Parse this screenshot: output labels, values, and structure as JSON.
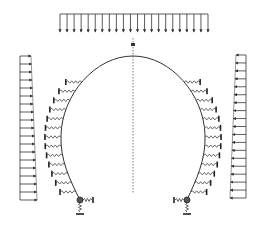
{
  "diagram": {
    "title": "",
    "type": "tunnel-lining-structural-model",
    "colors": {
      "line": "#333333",
      "spring": "#444444",
      "background": "#ffffff"
    },
    "elements": {
      "top_load": {
        "kind": "uniform-vertical-distributed-load",
        "arrow_count": 22,
        "direction": "down"
      },
      "left_side_load": {
        "kind": "trapezoidal-horizontal-distributed-load",
        "arrow_count": 19,
        "direction": "right"
      },
      "right_side_load": {
        "kind": "trapezoidal-horizontal-distributed-load",
        "arrow_count": 19,
        "direction": "left"
      },
      "arch": {
        "kind": "horseshoe-arch-lining"
      },
      "centerline": {
        "kind": "dashed-symmetry-axis"
      },
      "left_springs": {
        "kind": "ground-spring-supports",
        "count": 13
      },
      "right_springs": {
        "kind": "ground-spring-supports",
        "count": 13
      },
      "left_base_support": {
        "kind": "spring-supported-pin"
      },
      "right_base_support": {
        "kind": "spring-supported-pin"
      }
    }
  }
}
